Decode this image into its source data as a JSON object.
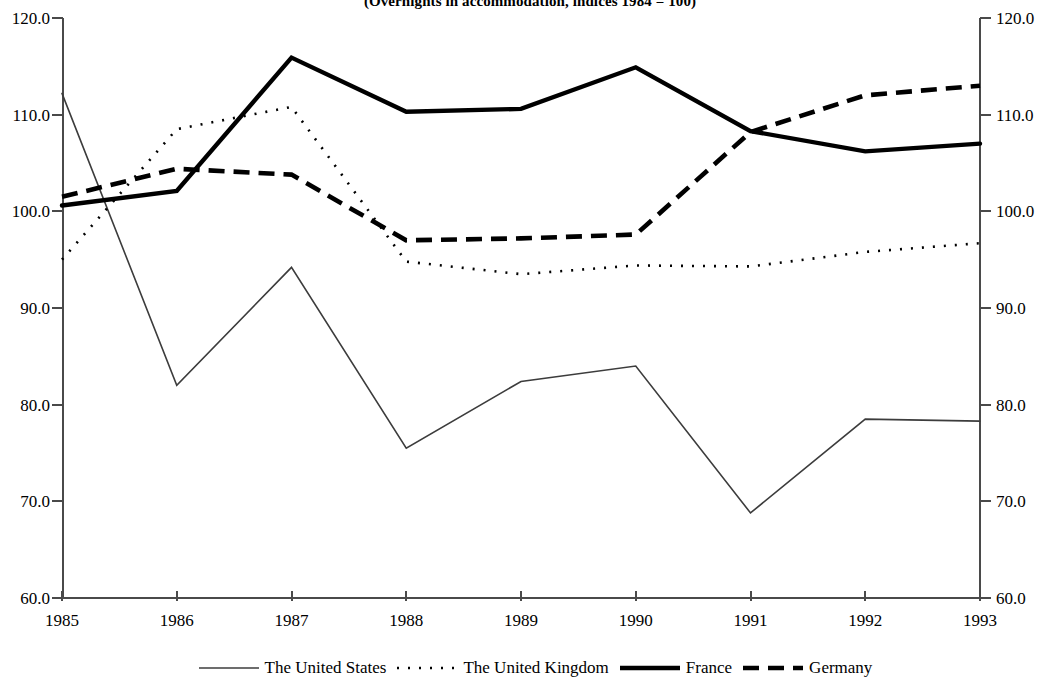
{
  "title": "(Overnights in accommodation, indices 1984 = 100)",
  "axes": {
    "y_ticks": [
      "120.0",
      "110.0",
      "100.0",
      "90.0",
      "80.0",
      "70.0",
      "60.0"
    ],
    "x_ticks": [
      "1985",
      "1986",
      "1987",
      "1988",
      "1989",
      "1990",
      "1991",
      "1992",
      "1993"
    ]
  },
  "legend": {
    "items": [
      {
        "label": "The United States",
        "style": "thin-solid",
        "color": "#3c3c3c"
      },
      {
        "label": "The United Kingdom",
        "style": "dotted",
        "color": "#000000"
      },
      {
        "label": "France",
        "style": "thick-solid",
        "color": "#000000"
      },
      {
        "label": "Germany",
        "style": "thick-dashed",
        "color": "#000000"
      }
    ]
  },
  "chart_data": {
    "type": "line",
    "title": "(Overnights in accommodation, indices 1984 = 100)",
    "xlabel": "",
    "ylabel": "",
    "ylim": [
      60.0,
      120.0
    ],
    "ytick_step": 10.0,
    "grid": false,
    "legend_position": "bottom",
    "x": [
      1985,
      1986,
      1987,
      1988,
      1989,
      1990,
      1991,
      1992,
      1993
    ],
    "categories": [
      "1985",
      "1986",
      "1987",
      "1988",
      "1989",
      "1990",
      "1991",
      "1992",
      "1993"
    ],
    "series": [
      {
        "name": "The United States",
        "style": "thin-solid",
        "color": "#3c3c3c",
        "values": [
          112.2,
          82.0,
          94.2,
          75.5,
          82.4,
          84.0,
          68.8,
          78.5,
          78.3
        ]
      },
      {
        "name": "The United Kingdom",
        "style": "dotted",
        "color": "#000000",
        "values": [
          95.0,
          108.5,
          110.8,
          94.8,
          93.5,
          94.4,
          94.3,
          95.8,
          96.7
        ]
      },
      {
        "name": "France",
        "style": "thick-solid",
        "color": "#000000",
        "values": [
          100.6,
          102.1,
          115.9,
          110.3,
          110.6,
          114.9,
          108.3,
          106.2,
          107.0
        ]
      },
      {
        "name": "Germany",
        "style": "thick-dashed",
        "color": "#000000",
        "values": [
          101.5,
          104.4,
          103.8,
          97.0,
          97.2,
          97.6,
          108.2,
          112.0,
          113.0
        ]
      }
    ]
  }
}
